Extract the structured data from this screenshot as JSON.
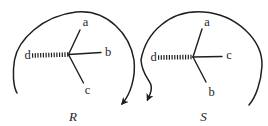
{
  "figure": {
    "colors": {
      "ink": "#1e1e1e",
      "background": "#ffffff"
    },
    "diagrams": [
      {
        "title": "R",
        "direction": "clockwise",
        "substituents": [
          {
            "position": "top",
            "label": "a"
          },
          {
            "position": "right",
            "label": "b"
          },
          {
            "position": "bottom",
            "label": "c"
          },
          {
            "position": "left-hashed",
            "label": "d"
          }
        ]
      },
      {
        "title": "S",
        "direction": "counterclockwise",
        "substituents": [
          {
            "position": "top",
            "label": "a"
          },
          {
            "position": "right",
            "label": "c"
          },
          {
            "position": "bottom",
            "label": "b"
          },
          {
            "position": "left-hashed",
            "label": "d"
          }
        ]
      }
    ]
  }
}
